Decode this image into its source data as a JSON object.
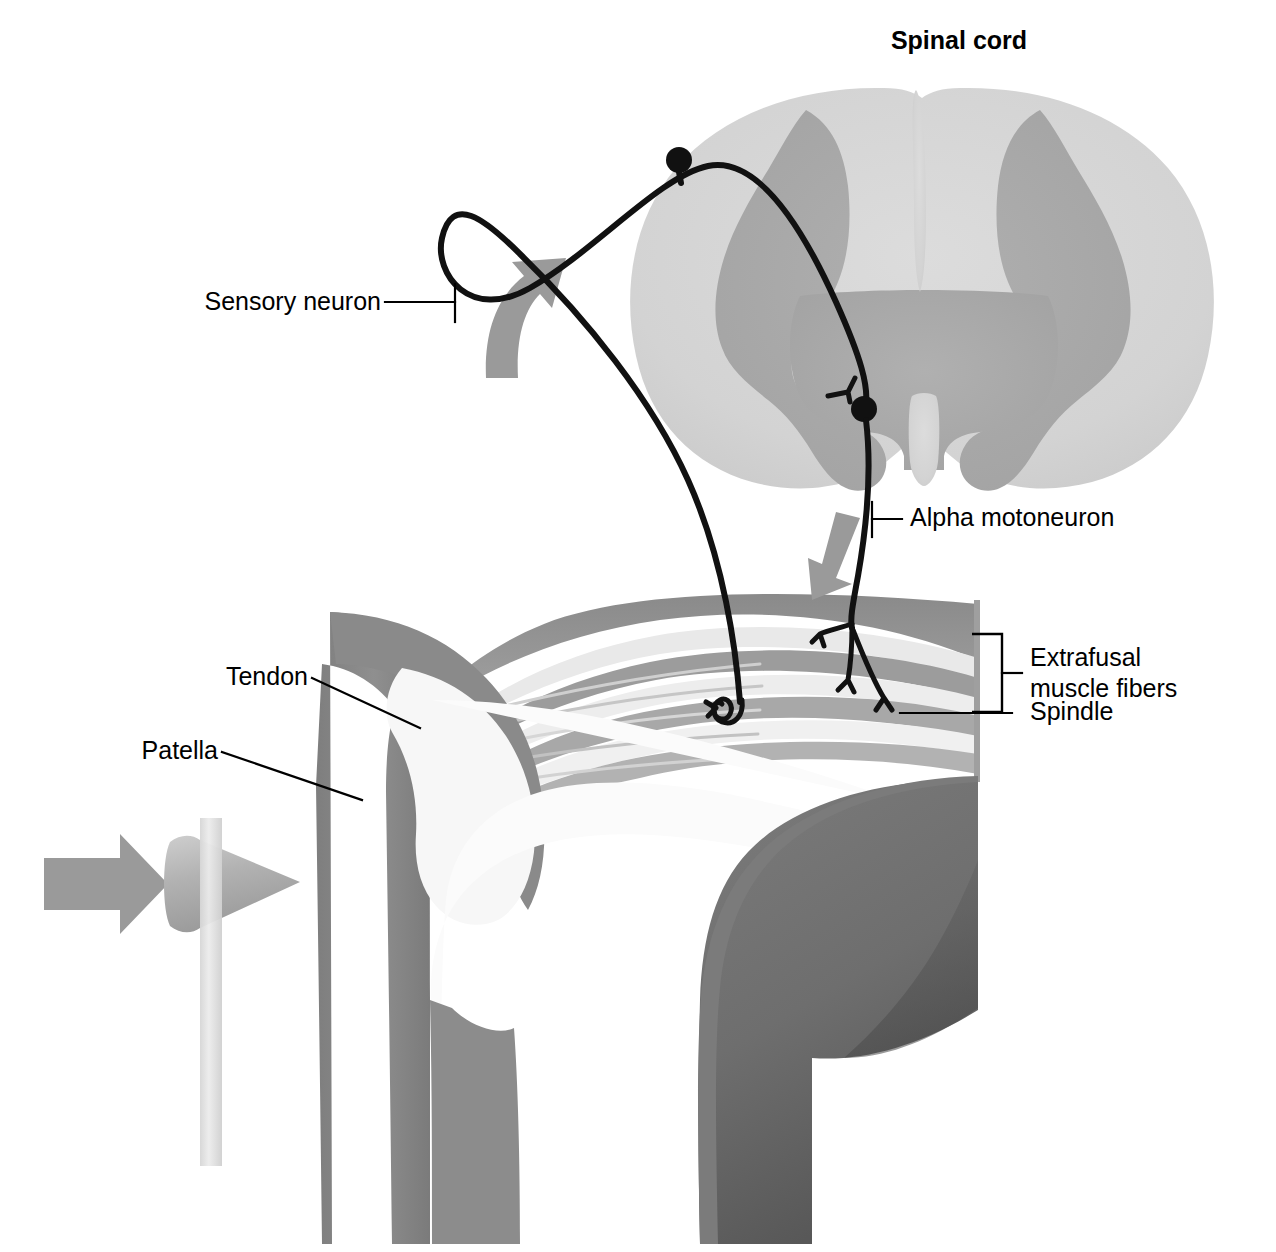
{
  "figure": {
    "background_color": "#ffffff"
  },
  "labels": {
    "spinal_cord": "Spinal cord",
    "sensory_neuron": "Sensory neuron",
    "alpha_motoneuron": "Alpha motoneuron",
    "extrafusal_line1": "Extrafusal",
    "extrafusal_line2": "muscle fibers",
    "spindle": "Spindle",
    "tendon": "Tendon",
    "patella": "Patella"
  },
  "colors": {
    "background": "#ffffff",
    "ink": "#000000",
    "white_matter": "#d4d4d4",
    "gray_matter": "#aaaaaa",
    "bone_light": "#f2f2f2",
    "bone_mid": "#8f8f8f",
    "femur_dark": "#6e6e6e",
    "femur_shade": "#4f4f4f",
    "muscle_dark": "#8c8c8c",
    "muscle_mid": "#b5b5b5",
    "muscle_light": "#e4e4e4",
    "arrow_gray": "#9a9a9a",
    "hammer_head": "#b0b0b0",
    "hammer_handle": "#e0e0e0",
    "neuron_black": "#111111"
  },
  "structures": {
    "spinal_cord_section": "spinal-cord-cross-section",
    "gray_matter_butterfly": "gray-matter-butterfly",
    "dorsal_root_ganglion": "dorsal-root-ganglion-cell-body",
    "sensory_axon": "sensory-afferent-axon",
    "synapse_terminal": "sensory-synaptic-terminal",
    "motoneuron_soma": "alpha-motoneuron-cell-body",
    "motor_axon": "alpha-motoneuron-axon",
    "motor_end_plates": "motor-end-plates",
    "annulospiral_ending": "annulospiral-sensory-ending",
    "muscle_belly": "quadriceps-muscle-belly",
    "patellar_tendon": "patellar-tendon",
    "patella_bone": "patella-bone",
    "femur": "femur",
    "tibia": "tibia",
    "reflex_hammer": "reflex-hammer",
    "afferent_arrow": "afferent-direction-arrow",
    "efferent_arrow": "efferent-direction-arrow",
    "tap_arrow": "hammer-tap-arrow"
  }
}
